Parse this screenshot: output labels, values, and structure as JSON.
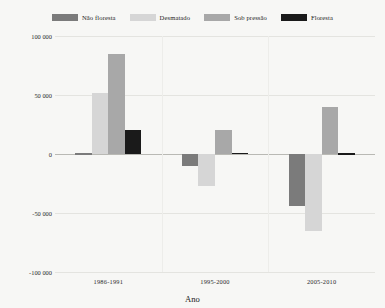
{
  "chart_data": {
    "type": "bar",
    "title": "",
    "xlabel": "Ano",
    "ylabel": "Migração líquida total",
    "categories": [
      "1986-1991",
      "1995-2000",
      "2005-2010"
    ],
    "ylim": [
      -100000,
      100000
    ],
    "yticks": [
      100000,
      50000,
      0,
      -50000,
      -100000
    ],
    "ytick_labels": [
      "100 000",
      "50 000",
      "0",
      "-50 000",
      "-100 000"
    ],
    "grid": true,
    "legend_position": "top",
    "series": [
      {
        "name": "Não floresta",
        "color": "#7b7b7b",
        "values": [
          600,
          -10000,
          -44000
        ]
      },
      {
        "name": "Desmatado",
        "color": "#d6d6d6",
        "values": [
          52000,
          -27000,
          -65000
        ]
      },
      {
        "name": "Sob pressão",
        "color": "#a8a8a8",
        "values": [
          85000,
          20000,
          40000
        ]
      },
      {
        "name": "Floresta",
        "color": "#1a1a1a",
        "values": [
          20000,
          900,
          700
        ]
      }
    ]
  },
  "colors": {
    "background": "#f7f7f5",
    "gridline": "#e4e4e0",
    "zeroline": "#b9b9b4",
    "text": "#1c1c1c"
  }
}
